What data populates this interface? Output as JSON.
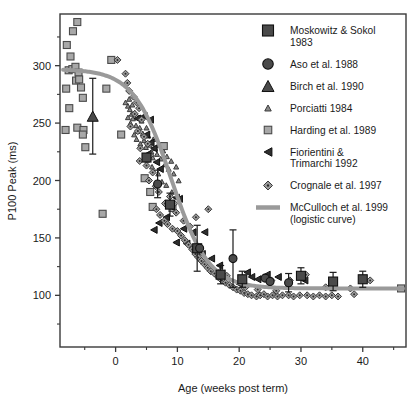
{
  "figure": {
    "title": "",
    "background_color": "#ffffff",
    "frame_color": "#3a3a3a"
  },
  "chart_data": {
    "type": "scatter",
    "title": "",
    "subtitle": "",
    "xlabel": "Age (weeks post term)",
    "ylabel": "P100 Peak (ms)",
    "xlim": [
      -9,
      47
    ],
    "ylim": [
      55,
      345
    ],
    "xticks": [
      0,
      10,
      20,
      30,
      40
    ],
    "xtick_labels": [
      "0",
      "10",
      "20",
      "30",
      "40"
    ],
    "yticks": [
      100,
      150,
      200,
      250,
      300
    ],
    "ytick_labels": [
      "100",
      "150",
      "200",
      "250",
      "300"
    ],
    "x_minor_ticks": [
      -5,
      5,
      15,
      25,
      35,
      45
    ],
    "y_minor_ticks": [
      75,
      125,
      175,
      225,
      275,
      325
    ],
    "grid": false,
    "legend_position": "top-right",
    "series": [
      {
        "name": "Moskowitz & Sokol 1983",
        "marker": "square",
        "marker_size": 9,
        "color": "#4a4a4a",
        "edge_color": "#111111",
        "has_error_bars": true,
        "points": [
          {
            "x": 5.0,
            "y": 220,
            "yerr": 0
          },
          {
            "x": 8.8,
            "y": 179,
            "yerr": 10
          },
          {
            "x": 13.2,
            "y": 141,
            "yerr": 20
          },
          {
            "x": 17.0,
            "y": 118,
            "yerr": 8
          },
          {
            "x": 20.5,
            "y": 114,
            "yerr": 7
          },
          {
            "x": 30.0,
            "y": 117,
            "yerr": 7
          },
          {
            "x": 35.2,
            "y": 112,
            "yerr": 8
          },
          {
            "x": 40.0,
            "y": 114,
            "yerr": 7
          }
        ]
      },
      {
        "name": "Aso et al. 1988",
        "marker": "circle",
        "marker_size": 8,
        "color": "#4a4a4a",
        "edge_color": "#111111",
        "has_error_bars": true,
        "points": [
          {
            "x": 6.8,
            "y": 197,
            "yerr": 12
          },
          {
            "x": 13.6,
            "y": 141,
            "yerr": 0
          },
          {
            "x": 19.0,
            "y": 132,
            "yerr": 25
          },
          {
            "x": 24.2,
            "y": 115,
            "yerr": 0
          },
          {
            "x": 25.0,
            "y": 112,
            "yerr": 0
          },
          {
            "x": 28.0,
            "y": 111,
            "yerr": 8
          }
        ]
      },
      {
        "name": "Birch et al. 1990",
        "marker": "triangle-up",
        "marker_size": 11,
        "color": "#4a4a4a",
        "edge_color": "#111111",
        "has_error_bars": true,
        "points": [
          {
            "x": -3.7,
            "y": 256,
            "yerr": 33
          }
        ]
      },
      {
        "name": "Porciatti 1984",
        "marker": "triangle-up",
        "marker_size": 5,
        "color": "#8a8a8a",
        "edge_color": "#3a3a3a",
        "has_error_bars": false,
        "points": [
          {
            "x": 1.6,
            "y": 268
          },
          {
            "x": 2.0,
            "y": 265
          },
          {
            "x": 2.3,
            "y": 262
          },
          {
            "x": 2.6,
            "y": 258
          },
          {
            "x": 2.0,
            "y": 255
          },
          {
            "x": 2.4,
            "y": 250
          },
          {
            "x": 2.8,
            "y": 254
          },
          {
            "x": 3.1,
            "y": 259
          },
          {
            "x": 3.3,
            "y": 248
          },
          {
            "x": 3.6,
            "y": 243
          },
          {
            "x": 3.0,
            "y": 240
          },
          {
            "x": 3.4,
            "y": 236
          },
          {
            "x": 3.9,
            "y": 246
          },
          {
            "x": 4.2,
            "y": 252
          },
          {
            "x": 4.4,
            "y": 241
          },
          {
            "x": 4.0,
            "y": 232
          },
          {
            "x": 4.6,
            "y": 235
          },
          {
            "x": 5.0,
            "y": 246
          },
          {
            "x": 5.3,
            "y": 239
          },
          {
            "x": 4.9,
            "y": 229
          },
          {
            "x": 5.5,
            "y": 231
          },
          {
            "x": 5.8,
            "y": 225
          },
          {
            "x": 6.1,
            "y": 236
          },
          {
            "x": 6.4,
            "y": 228
          },
          {
            "x": 6.0,
            "y": 220
          },
          {
            "x": 6.7,
            "y": 223
          },
          {
            "x": 7.0,
            "y": 231
          },
          {
            "x": 7.3,
            "y": 219
          },
          {
            "x": 7.7,
            "y": 226
          },
          {
            "x": 8.0,
            "y": 214
          },
          {
            "x": 8.3,
            "y": 221
          },
          {
            "x": 8.6,
            "y": 210
          },
          {
            "x": 9.0,
            "y": 217
          },
          {
            "x": 9.4,
            "y": 206
          },
          {
            "x": 9.8,
            "y": 212
          },
          {
            "x": 10.2,
            "y": 200
          },
          {
            "x": 2.2,
            "y": 271
          },
          {
            "x": 2.7,
            "y": 266
          },
          {
            "x": 3.7,
            "y": 255
          },
          {
            "x": 4.8,
            "y": 257
          },
          {
            "x": 5.1,
            "y": 218
          },
          {
            "x": 5.9,
            "y": 212
          },
          {
            "x": 6.9,
            "y": 206
          },
          {
            "x": 7.5,
            "y": 199
          },
          {
            "x": 8.2,
            "y": 196
          },
          {
            "x": 9.1,
            "y": 190
          }
        ]
      },
      {
        "name": "Harding et al. 1989",
        "marker": "square",
        "marker_size": 7,
        "color": "#a8a8a8",
        "edge_color": "#4a4a4a",
        "has_error_bars": false,
        "points": [
          {
            "x": -7.9,
            "y": 318
          },
          {
            "x": -7.3,
            "y": 308
          },
          {
            "x": -6.9,
            "y": 330
          },
          {
            "x": -6.2,
            "y": 338
          },
          {
            "x": -8.0,
            "y": 280
          },
          {
            "x": -7.6,
            "y": 296
          },
          {
            "x": -7.0,
            "y": 297
          },
          {
            "x": -6.5,
            "y": 299
          },
          {
            "x": -6.0,
            "y": 294
          },
          {
            "x": -7.5,
            "y": 263
          },
          {
            "x": -6.4,
            "y": 287
          },
          {
            "x": -5.9,
            "y": 288
          },
          {
            "x": -6.2,
            "y": 246
          },
          {
            "x": -5.6,
            "y": 281
          },
          {
            "x": -5.3,
            "y": 272
          },
          {
            "x": -5.2,
            "y": 244
          },
          {
            "x": -5.3,
            "y": 240
          },
          {
            "x": -4.9,
            "y": 229
          },
          {
            "x": -8.1,
            "y": 244
          },
          {
            "x": -2.1,
            "y": 171
          },
          {
            "x": -1.5,
            "y": 280
          },
          {
            "x": -0.7,
            "y": 305
          },
          {
            "x": 0.9,
            "y": 240
          },
          {
            "x": 4.7,
            "y": 202
          },
          {
            "x": 5.6,
            "y": 190
          },
          {
            "x": 6.0,
            "y": 177
          },
          {
            "x": 7.8,
            "y": 230
          },
          {
            "x": 9.2,
            "y": 176
          },
          {
            "x": 46.2,
            "y": 106
          }
        ]
      },
      {
        "name": "Fiorientini & Trimarchi 1992",
        "marker": "triangle-left",
        "marker_size": 7,
        "color": "#2e2e2e",
        "edge_color": "#111111",
        "has_error_bars": false,
        "points": [
          {
            "x": 4.6,
            "y": 256
          },
          {
            "x": 5.6,
            "y": 253
          },
          {
            "x": 3.5,
            "y": 254
          },
          {
            "x": 5.0,
            "y": 240
          },
          {
            "x": 5.7,
            "y": 233
          },
          {
            "x": 6.2,
            "y": 228
          },
          {
            "x": 5.2,
            "y": 223
          },
          {
            "x": 6.6,
            "y": 216
          },
          {
            "x": 7.2,
            "y": 210
          },
          {
            "x": 9.8,
            "y": 185
          },
          {
            "x": 10.3,
            "y": 184
          },
          {
            "x": 9.0,
            "y": 177
          },
          {
            "x": 8.2,
            "y": 168
          },
          {
            "x": 7.0,
            "y": 163
          },
          {
            "x": 6.2,
            "y": 157
          },
          {
            "x": 11.0,
            "y": 158
          },
          {
            "x": 12.5,
            "y": 155
          },
          {
            "x": 14.4,
            "y": 155
          },
          {
            "x": 11.5,
            "y": 145
          },
          {
            "x": 9.8,
            "y": 146
          },
          {
            "x": 14.0,
            "y": 136
          },
          {
            "x": 15.5,
            "y": 132
          },
          {
            "x": 16.8,
            "y": 126
          },
          {
            "x": 21.3,
            "y": 120
          },
          {
            "x": 22.0,
            "y": 116
          },
          {
            "x": 23.0,
            "y": 114
          },
          {
            "x": 24.5,
            "y": 118
          },
          {
            "x": 26.3,
            "y": 116
          },
          {
            "x": 20.0,
            "y": 110
          },
          {
            "x": 30.6,
            "y": 113
          }
        ]
      },
      {
        "name": "Crognale et al. 1997",
        "marker": "diamond-dot",
        "marker_size": 7,
        "color": "#9b9b9b",
        "edge_color": "#3a3a3a",
        "has_error_bars": false,
        "points": [
          {
            "x": 0.3,
            "y": 305
          },
          {
            "x": 1.6,
            "y": 293
          },
          {
            "x": 1.9,
            "y": 285
          },
          {
            "x": 2.2,
            "y": 278
          },
          {
            "x": 2.9,
            "y": 273
          },
          {
            "x": 3.4,
            "y": 268
          },
          {
            "x": 3.8,
            "y": 263
          },
          {
            "x": 3.1,
            "y": 258
          },
          {
            "x": 4.2,
            "y": 253
          },
          {
            "x": 2.4,
            "y": 247
          },
          {
            "x": 3.6,
            "y": 243
          },
          {
            "x": 4.6,
            "y": 238
          },
          {
            "x": 5.2,
            "y": 232
          },
          {
            "x": 4.0,
            "y": 228
          },
          {
            "x": 5.6,
            "y": 222
          },
          {
            "x": 3.9,
            "y": 217
          },
          {
            "x": 5.0,
            "y": 213
          },
          {
            "x": 6.0,
            "y": 207
          },
          {
            "x": 5.4,
            "y": 200
          },
          {
            "x": 6.5,
            "y": 195
          },
          {
            "x": 7.0,
            "y": 190
          },
          {
            "x": 8.8,
            "y": 186
          },
          {
            "x": 9.5,
            "y": 180
          },
          {
            "x": 6.6,
            "y": 175
          },
          {
            "x": 7.2,
            "y": 170
          },
          {
            "x": 7.9,
            "y": 165
          },
          {
            "x": 8.4,
            "y": 162
          },
          {
            "x": 9.2,
            "y": 158
          },
          {
            "x": 10.0,
            "y": 156
          },
          {
            "x": 10.6,
            "y": 152
          },
          {
            "x": 11.2,
            "y": 148
          },
          {
            "x": 11.8,
            "y": 144
          },
          {
            "x": 12.4,
            "y": 140
          },
          {
            "x": 12.9,
            "y": 136
          },
          {
            "x": 13.4,
            "y": 133
          },
          {
            "x": 13.9,
            "y": 130
          },
          {
            "x": 14.4,
            "y": 127
          },
          {
            "x": 14.9,
            "y": 124
          },
          {
            "x": 15.4,
            "y": 121
          },
          {
            "x": 16.0,
            "y": 119
          },
          {
            "x": 16.6,
            "y": 116
          },
          {
            "x": 17.2,
            "y": 113
          },
          {
            "x": 17.8,
            "y": 111
          },
          {
            "x": 18.4,
            "y": 109
          },
          {
            "x": 19.0,
            "y": 107
          },
          {
            "x": 19.6,
            "y": 105
          },
          {
            "x": 20.2,
            "y": 104
          },
          {
            "x": 20.8,
            "y": 102
          },
          {
            "x": 21.4,
            "y": 101
          },
          {
            "x": 22.0,
            "y": 100
          },
          {
            "x": 22.8,
            "y": 99
          },
          {
            "x": 23.4,
            "y": 100
          },
          {
            "x": 24.0,
            "y": 101
          },
          {
            "x": 24.6,
            "y": 99
          },
          {
            "x": 25.4,
            "y": 100
          },
          {
            "x": 26.2,
            "y": 99
          },
          {
            "x": 27.0,
            "y": 100
          },
          {
            "x": 28.0,
            "y": 100
          },
          {
            "x": 28.8,
            "y": 99
          },
          {
            "x": 29.8,
            "y": 100
          },
          {
            "x": 30.8,
            "y": 118
          },
          {
            "x": 31.0,
            "y": 100
          },
          {
            "x": 32.0,
            "y": 99
          },
          {
            "x": 33.0,
            "y": 100
          },
          {
            "x": 34.0,
            "y": 99
          },
          {
            "x": 35.0,
            "y": 100
          },
          {
            "x": 36.0,
            "y": 99
          },
          {
            "x": 38.0,
            "y": 106
          },
          {
            "x": 38.6,
            "y": 101
          },
          {
            "x": 41.2,
            "y": 113
          },
          {
            "x": 15.0,
            "y": 175
          },
          {
            "x": 13.0,
            "y": 168
          },
          {
            "x": 12.0,
            "y": 160
          },
          {
            "x": 17.0,
            "y": 121
          },
          {
            "x": 18.0,
            "y": 117
          },
          {
            "x": 21.0,
            "y": 107
          },
          {
            "x": 23.0,
            "y": 105
          },
          {
            "x": 26.0,
            "y": 104
          },
          {
            "x": 11.0,
            "y": 165
          },
          {
            "x": 8.0,
            "y": 180
          },
          {
            "x": 28.2,
            "y": 113
          },
          {
            "x": 25.2,
            "y": 113
          },
          {
            "x": 34.0,
            "y": 107
          },
          {
            "x": 9.8,
            "y": 172
          }
        ]
      }
    ],
    "curve": {
      "name": "McCulloch et al. 1999 (logistic curve)",
      "type": "logistic",
      "color": "#9a9a9a",
      "line_width": 4,
      "asymptote_low": 106,
      "asymptote_high": 297,
      "midpoint_x": 9.0,
      "slope": 0.33,
      "x_start": -8.5,
      "x_end": 46.5
    }
  },
  "legend": {
    "items": [
      {
        "marker": "square-large",
        "label": "Moskowitz & Sokol 1983",
        "label_lines": [
          "Moskowitz & Sokol",
          "1983"
        ],
        "color": "#4a4a4a"
      },
      {
        "marker": "circle-large",
        "label": "Aso et al. 1988",
        "label_lines": [
          "Aso et al. 1988"
        ],
        "color": "#4a4a4a"
      },
      {
        "marker": "triangle-large",
        "label": "Birch et al. 1990",
        "label_lines": [
          "Birch et al. 1990"
        ],
        "color": "#4a4a4a"
      },
      {
        "marker": "triangle-small",
        "label": "Porciatti 1984",
        "label_lines": [
          "Porciatti 1984"
        ],
        "color": "#8a8a8a"
      },
      {
        "marker": "square-small",
        "label": "Harding et al. 1989",
        "label_lines": [
          "Harding et al. 1989"
        ],
        "color": "#a8a8a8"
      },
      {
        "marker": "triangle-left",
        "label": "Fiorientini & Trimarchi 1992",
        "label_lines": [
          "Fiorientini &",
          "Trimarchi 1992"
        ],
        "color": "#2e2e2e"
      },
      {
        "marker": "diamond-dot",
        "label": "Crognale et al. 1997",
        "label_lines": [
          "Crognale et al. 1997"
        ],
        "color": "#9b9b9b"
      },
      {
        "marker": "line",
        "label": "McCulloch et al. 1999 (logistic curve)",
        "label_lines": [
          "McCulloch et al. 1999",
          "(logistic curve)"
        ],
        "color": "#9a9a9a"
      }
    ]
  }
}
